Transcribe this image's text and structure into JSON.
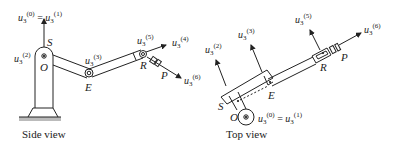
{
  "figure": {
    "side_view": {
      "caption": "Side view",
      "points": {
        "S": "S",
        "O": "O",
        "E": "E",
        "R": "R",
        "P": "P"
      },
      "vectors": {
        "u0_eq_u1": {
          "a": "u",
          "sub": "3",
          "sup_a": "(0)",
          "eq": "=",
          "b": "u",
          "sup_b": "(1)"
        },
        "u2": {
          "base": "u",
          "sub": "3",
          "sup": "(2)"
        },
        "u3": {
          "base": "u",
          "sub": "3",
          "sup": "(3)"
        },
        "u4": {
          "base": "u",
          "sub": "3",
          "sup": "(4)"
        },
        "u5": {
          "base": "u",
          "sub": "3",
          "sup": "(5)"
        },
        "u6": {
          "base": "u",
          "sub": "3",
          "sup": "(6)"
        }
      }
    },
    "top_view": {
      "caption": "Top view",
      "points": {
        "S": "S",
        "O": "O",
        "E": "E",
        "R": "R",
        "P": "P"
      },
      "vectors": {
        "u0_eq_u1": {
          "a": "u",
          "sub": "3",
          "sup_a": "(0)",
          "eq": "=",
          "b": "u",
          "sup_b": "(1)"
        },
        "u2": {
          "base": "u",
          "sub": "3",
          "sup": "(2)"
        },
        "u3": {
          "base": "u",
          "sub": "3",
          "sup": "(3)"
        },
        "u5": {
          "base": "u",
          "sub": "3",
          "sup": "(5)"
        },
        "u6": {
          "base": "u",
          "sub": "3",
          "sup": "(6)"
        }
      }
    },
    "colors": {
      "ink": "#222222",
      "ground": "#9a9a9a"
    }
  }
}
